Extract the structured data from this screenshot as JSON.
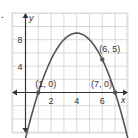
{
  "problem_marker": ".",
  "chart_data": {
    "type": "line",
    "title": "",
    "xlabel": "x",
    "ylabel": "y",
    "xlim": [
      -1,
      8
    ],
    "ylim": [
      -4,
      10
    ],
    "grid": true,
    "x_ticks": [
      2,
      4,
      6
    ],
    "y_ticks": [
      4,
      8
    ],
    "tick_labels": {
      "x": [
        "2",
        "4",
        "6"
      ],
      "y": [
        "4",
        "8"
      ]
    },
    "series": [
      {
        "name": "parabola",
        "equation": "y = -(x - 1)(x - 7)",
        "vertex": [
          4,
          9
        ]
      }
    ],
    "points": [
      {
        "x": 1,
        "y": 0,
        "label": "(1, 0)"
      },
      {
        "x": 7,
        "y": 0,
        "label": "(7, 0)"
      },
      {
        "x": 6,
        "y": 5,
        "label": "(6, 5)"
      }
    ],
    "colors": {
      "curve": "#555555",
      "grid": "#d9d9d9",
      "axis": "#333333"
    }
  }
}
